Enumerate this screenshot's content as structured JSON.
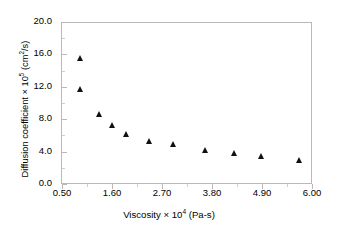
{
  "chart_data": {
    "type": "scatter",
    "title": "",
    "xlabel": "Viscosity × 10⁴ (Pa-s)",
    "ylabel": "Diffusion coefficient × 10⁵ (cm²/s)",
    "xlim": [
      0.5,
      6.0
    ],
    "ylim": [
      0.0,
      20.0
    ],
    "xticks": [
      "0.50",
      "1.60",
      "2.70",
      "3.80",
      "4.90",
      "6.00"
    ],
    "xtick_values": [
      0.5,
      1.6,
      2.7,
      3.8,
      4.9,
      6.0
    ],
    "yticks": [
      "0.0",
      "4.0",
      "8.0",
      "12.0",
      "16.0",
      "20.0"
    ],
    "ytick_values": [
      0.0,
      4.0,
      8.0,
      12.0,
      16.0,
      20.0
    ],
    "grid": false,
    "legend": null,
    "marker": "filled-triangle",
    "marker_color": "#111111",
    "series": [
      {
        "name": "Diffusion coefficient",
        "x": [
          0.92,
          0.92,
          1.32,
          1.62,
          1.92,
          2.42,
          2.96,
          3.66,
          4.3,
          4.9,
          5.72
        ],
        "y": [
          15.5,
          11.7,
          8.6,
          7.3,
          6.1,
          5.3,
          4.9,
          4.2,
          3.8,
          3.4,
          3.0
        ]
      }
    ]
  },
  "axis": {
    "x_title_prefix": "Viscosity ",
    "x_title_mult": "× 10",
    "x_title_exp": "4",
    "x_title_unit": " (Pa-s)",
    "y_title_prefix": "Diffusion coefficient ",
    "y_title_mult": "× 10",
    "y_title_exp": "5",
    "y_title_unit": " (cm",
    "y_title_exp2": "2",
    "y_title_unit2": "/s)"
  }
}
